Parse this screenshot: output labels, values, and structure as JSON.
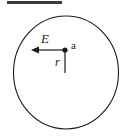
{
  "figure": {
    "background_color": "#ffffff",
    "stroke_color": "#1a1a1a",
    "top_rule": {
      "name": "top-rule",
      "x1": 7,
      "y1": 2.5,
      "x2": 62,
      "y2": 2.5,
      "thickness": 3,
      "color": "#3a3a3a"
    },
    "circle": {
      "name": "boundary-circle",
      "cx": 66,
      "cy": 72.5,
      "rx": 52.5,
      "ry": 56.5,
      "stroke_width": 1.1,
      "fill": "none"
    },
    "point": {
      "name": "point-a",
      "cx": 65,
      "cy": 50,
      "radius": 2.6,
      "label": "a",
      "label_x": 71,
      "label_y": 49,
      "label_size": 11
    },
    "field_arrow": {
      "name": "field-vector-E",
      "x_start": 65,
      "y_start": 50,
      "x_end": 31,
      "y_end": 50,
      "stroke_width": 1.2,
      "head_length": 8,
      "head_width": 7,
      "label": "E",
      "label_x": 41,
      "label_y": 43,
      "label_size": 13
    },
    "radius_line": {
      "name": "radius-segment-r",
      "x_start": 65,
      "y_start": 50,
      "x_end": 65,
      "y_end": 73,
      "stroke_width": 1.2,
      "label": "r",
      "label_x": 55,
      "label_y": 66,
      "label_size": 12
    }
  }
}
